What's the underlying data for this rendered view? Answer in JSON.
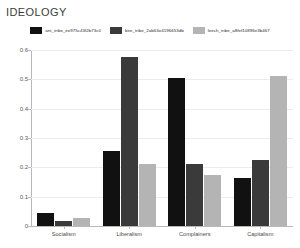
{
  "chart_data": {
    "type": "bar",
    "title": "IDEOLOGY",
    "xlabel": "",
    "ylabel": "",
    "ylim": [
      0,
      0.6
    ],
    "yticks": [
      0,
      0.1,
      0.2,
      0.3,
      0.4,
      0.5,
      0.6
    ],
    "ytick_labels": [
      "0",
      "0.1",
      "0.2",
      "0.3",
      "0.4",
      "0.5",
      "0.6"
    ],
    "grid": true,
    "legend_position": "top-center",
    "categories": [
      "Socialism",
      "Liberalism",
      "Complainers",
      "Capitalism"
    ],
    "series": [
      {
        "name": "ant_tribe_ee975c43f2b73c0",
        "color": "#111111",
        "values": [
          0.045,
          0.255,
          0.505,
          0.165
        ]
      },
      {
        "name": "bee_tribe_2ab63e4196653db",
        "color": "#3a3a3a",
        "values": [
          0.018,
          0.575,
          0.21,
          0.225
        ]
      },
      {
        "name": "leech_tribe_a8fef10896e3b467",
        "color": "#b4b4b4",
        "values": [
          0.028,
          0.21,
          0.175,
          0.51
        ]
      }
    ]
  }
}
